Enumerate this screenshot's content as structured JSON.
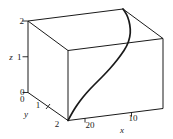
{
  "figure": {
    "kind": "3d-parametric-curve-plot",
    "background": "#ffffff",
    "line_color": "#1a1a1a"
  },
  "axes": {
    "z": {
      "label": "z",
      "ticks": [
        "0",
        "1",
        "2"
      ]
    },
    "y": {
      "label": "y",
      "ticks": [
        "0",
        "1",
        "2"
      ]
    },
    "x": {
      "label": "x",
      "ticks": [
        "20",
        "10"
      ]
    }
  },
  "chart_data": {
    "type": "line",
    "subtype": "3d-space-curve-in-bounding-box",
    "title": "",
    "x_axis": {
      "label": "x",
      "tick_values": [
        20,
        10
      ],
      "range": [
        0,
        25
      ],
      "note": "axis runs along front-bottom edge, values decrease left-to-right"
    },
    "y_axis": {
      "label": "y",
      "tick_values": [
        0,
        1,
        2
      ],
      "range": [
        0,
        2
      ],
      "note": "axis runs along lower-left edge toward viewer"
    },
    "z_axis": {
      "label": "z",
      "tick_values": [
        0,
        1,
        2
      ],
      "range": [
        0,
        2
      ],
      "note": "vertical left edge"
    },
    "grid": false,
    "legend": false,
    "bounding_box": {
      "x_range": [
        0,
        25
      ],
      "y_range": [
        0,
        2
      ],
      "z_range": [
        0,
        2
      ]
    },
    "curve": {
      "description": "Smooth S-shaped space curve rising from the front-bottom corner (x≈25, y=2, z=0) to the top back corner (x=0, y=0, z=2)",
      "start_point_3d": {
        "x": 25,
        "y": 2,
        "z": 0
      },
      "end_point_3d": {
        "x": 0,
        "y": 0,
        "z": 2
      },
      "projected_points_px": [
        [
          68,
          120.5
        ],
        [
          72,
          113
        ],
        [
          77,
          105
        ],
        [
          83,
          97
        ],
        [
          90,
          89
        ],
        [
          98,
          81
        ],
        [
          106,
          73
        ],
        [
          114,
          64
        ],
        [
          121,
          55
        ],
        [
          127,
          46
        ],
        [
          130,
          37
        ],
        [
          130.5,
          29
        ],
        [
          129,
          20.5
        ],
        [
          126.5,
          14
        ],
        [
          123,
          9
        ]
      ]
    }
  }
}
